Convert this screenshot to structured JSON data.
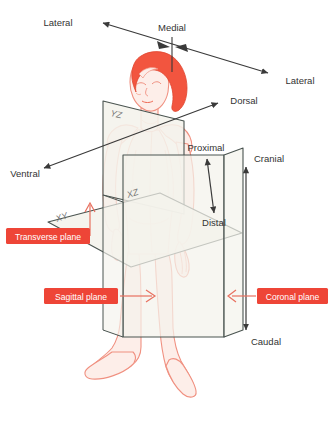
{
  "figure": {
    "colors": {
      "callout_box": "#ee4537",
      "callout_text": "#ffffff",
      "callout_line": "#e8705f",
      "plane_fill": "#f4f3ec",
      "plane_stroke": "#4a5450",
      "plane_code_text": "#777777",
      "axis_line": "#3a3a3a",
      "axis_text": "#333333",
      "hair": "#f2553f",
      "skin_fill": "#fdeee9",
      "skin_outline": "#f09080",
      "background": "#ffffff"
    }
  },
  "direction_labels": {
    "lateral_left": "Lateral",
    "lateral_right": "Lateral",
    "medial": "Medial",
    "dorsal": "Dorsal",
    "ventral": "Ventral",
    "proximal": "Proximal",
    "distal": "Distal",
    "cranial": "Cranial",
    "caudal": "Caudal"
  },
  "plane_codes": {
    "yz": "YZ",
    "xz": "XZ",
    "xy": "XY"
  },
  "plane_callouts": {
    "transverse": "Transverse plane",
    "sagittal": "Sagittal plane",
    "coronal": "Coronal plane"
  }
}
